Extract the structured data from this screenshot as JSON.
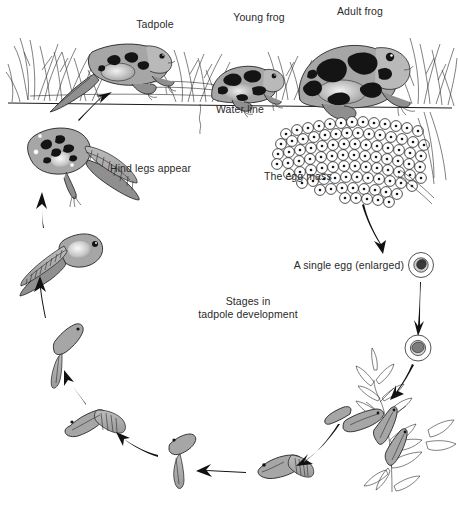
{
  "diagram": {
    "canvas": {
      "width": 458,
      "height": 510,
      "background": "#ffffff"
    },
    "ink_color": "#1b1b1b",
    "body_fill": "#a6a6a6",
    "label_color": "#2a2a2a"
  },
  "labels": {
    "tadpole": "Tadpole",
    "young_frog": "Young frog",
    "adult_frog": "Adult frog",
    "water_line": "Water line",
    "hind_legs": "Hind legs appear",
    "egg_mass": "The egg mass",
    "single_egg": "A single egg (enlarged)",
    "center_line1": "Stages in",
    "center_line2": "tadpole development"
  },
  "stages": [
    {
      "id": "adult-frog",
      "name": "Adult frog",
      "order": 1
    },
    {
      "id": "egg-mass",
      "name": "The egg mass",
      "order": 2
    },
    {
      "id": "single-egg",
      "name": "A single egg (enlarged)",
      "order": 3
    },
    {
      "id": "hatching-egg",
      "name": "Hatching egg",
      "order": 4
    },
    {
      "id": "hatchlings-on-plant",
      "name": "Newly hatched tadpoles on plant",
      "order": 5
    },
    {
      "id": "tadpole-early",
      "name": "Early tadpole",
      "order": 6
    },
    {
      "id": "tadpole-swimming",
      "name": "Swimming tadpole",
      "order": 7
    },
    {
      "id": "tadpole-growing",
      "name": "Growing tadpole",
      "order": 8
    },
    {
      "id": "tadpole-legbud",
      "name": "Tadpole with leg buds",
      "order": 9
    },
    {
      "id": "tadpole-large",
      "name": "Large tadpole",
      "order": 10
    },
    {
      "id": "tadpole-hind-legs",
      "name": "Tadpole with hind legs",
      "order": 11
    },
    {
      "id": "froglet",
      "name": "Tadpole becoming frog",
      "order": 12
    },
    {
      "id": "young-frog",
      "name": "Young frog",
      "order": 13
    }
  ]
}
